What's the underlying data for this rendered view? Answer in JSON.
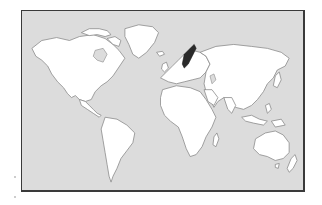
{
  "map": {
    "type": "world-map",
    "projection": "equirectangular-like",
    "background_color": "#ffffff",
    "ocean_color": "#dcdcdc",
    "land_color": "#ffffff",
    "border_color": "#3a3a3a",
    "highlighted_region": {
      "name": "Sweden",
      "color": "#2a2a2a"
    },
    "continents": [
      "North America",
      "Greenland",
      "South America",
      "Europe",
      "Africa",
      "Asia",
      "Australia",
      "New Zealand"
    ]
  }
}
